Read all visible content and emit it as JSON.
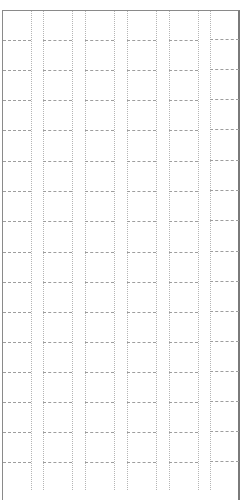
{
  "caption": {
    "text": "",
    "color": "#bdbdbd"
  },
  "grid": {
    "frame_color": "#8a8a8a",
    "line_color": "#9e9e9e",
    "columns": [
      {
        "x1": 3,
        "x2": 31
      },
      {
        "x1": 43,
        "x2": 72
      },
      {
        "x1": 85,
        "x2": 114
      },
      {
        "x1": 127,
        "x2": 156
      },
      {
        "x1": 169,
        "x2": 198
      },
      {
        "x1": 210,
        "x2": 239
      }
    ],
    "vertical_lines_x": [
      31,
      43,
      72,
      85,
      114,
      127,
      156,
      169,
      198,
      210
    ],
    "row_lines_y": [
      40,
      70,
      100,
      130,
      161,
      191,
      221,
      252,
      282,
      312,
      342,
      372,
      402,
      432,
      462
    ],
    "row_count": 15,
    "column_count": 6
  }
}
